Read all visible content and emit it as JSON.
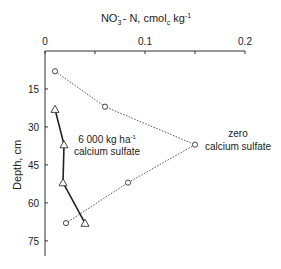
{
  "chart_data": {
    "type": "line",
    "title": "NO3- - N, cmolc kg-1",
    "title_parts": {
      "main": "NO",
      "sub": "3",
      "sup": "-",
      "rest1": " - N, cmol",
      "sub2": "c",
      "rest2": " kg",
      "sup2": "-1"
    },
    "xlabel_position": "top",
    "ylabel": "Depth, cm",
    "xlim": [
      0,
      0.2
    ],
    "ylim": [
      0,
      81
    ],
    "y_inverted": true,
    "x_ticks": [
      0,
      0.05,
      0.1,
      0.15,
      0.2
    ],
    "x_tick_labels": [
      "0",
      "",
      "0.1",
      "",
      "0.2"
    ],
    "y_ticks": [
      15,
      30,
      45,
      60,
      75
    ],
    "y_tick_labels": [
      "15",
      "30",
      "45",
      "60",
      "75"
    ],
    "series": [
      {
        "name": "zero calcium sulfate",
        "label_lines": [
          "zero",
          "calcium sulfate"
        ],
        "marker": "circle",
        "line_style": "dotted",
        "x": [
          0.01,
          0.06,
          0.15,
          0.083,
          0.021
        ],
        "depth": [
          8,
          22,
          37,
          52,
          68
        ]
      },
      {
        "name": "6 000 kg ha-1 calcium sulfate",
        "label_lines": [
          "6 000 kg ha",
          "calcium sulfate"
        ],
        "label_sup": "-1",
        "marker": "triangle",
        "line_style": "solid",
        "x": [
          0.01,
          0.019,
          0.018,
          0.04
        ],
        "depth": [
          23,
          37,
          52,
          68
        ]
      }
    ],
    "grid": false,
    "legend": "inline annotations"
  }
}
